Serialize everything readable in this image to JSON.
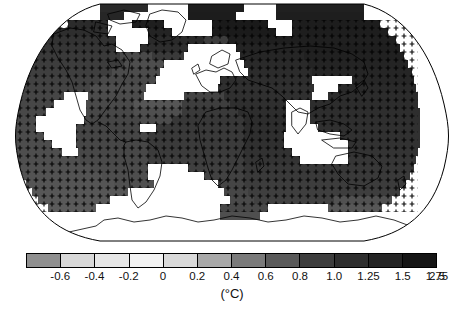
{
  "figure": {
    "type": "global-temperature-anomaly-map",
    "projection": "Robinson"
  },
  "chart_data": {
    "type": "heatmap",
    "title": "",
    "subtitle": "",
    "xlabel": "",
    "ylabel": "",
    "units": "(°C)",
    "projection": "Robinson",
    "grid": false,
    "legend_position": "bottom",
    "colormap": "grayscale-discrete-light-to-dark",
    "stippling": {
      "marker": "+",
      "meaning": "statistically significant change",
      "color": "#000000"
    },
    "nodata": {
      "fill": "#ffffff",
      "meaning": "insufficient data / masked"
    },
    "colorbar": {
      "orientation": "horizontal",
      "label": "(°C)",
      "tick_labels": [
        "-0.6",
        "-0.4",
        "-0.2",
        "0",
        "0.2",
        "0.4",
        "0.6",
        "0.8",
        "1.0",
        "1.25",
        "1.5",
        "1.75",
        "2.5"
      ],
      "boundaries": [
        -0.6,
        -0.4,
        -0.2,
        0,
        0.2,
        0.4,
        0.6,
        0.8,
        1.0,
        1.25,
        1.5,
        1.75,
        2.5
      ],
      "segment_colors": [
        "#8f8f8f",
        "#d8d8d8",
        "#e6e6e6",
        "#f2f2f2",
        "#d9d9d9",
        "#a8a8a8",
        "#7a7a7a",
        "#5a5a5a",
        "#3d3d3d",
        "#2e2e2e",
        "#242424",
        "#151515"
      ],
      "n_segments": 12,
      "extend": "neither"
    },
    "value_range_displayed": [
      -0.6,
      2.5
    ]
  },
  "colorbar_ticks": [
    {
      "label": "-0.6",
      "position_pct": 8.33
    },
    {
      "label": "-0.4",
      "position_pct": 16.67
    },
    {
      "label": "-0.2",
      "position_pct": 25.0
    },
    {
      "label": "0",
      "position_pct": 33.33
    },
    {
      "label": "0.2",
      "position_pct": 41.67
    },
    {
      "label": "0.4",
      "position_pct": 50.0
    },
    {
      "label": "0.6",
      "position_pct": 58.33
    },
    {
      "label": "0.8",
      "position_pct": 66.67
    },
    {
      "label": "1.0",
      "position_pct": 75.0
    },
    {
      "label": "1.25",
      "position_pct": 83.33
    },
    {
      "label": "1.5",
      "position_pct": 91.67
    },
    {
      "label": "1.75",
      "position_pct": 100.0
    },
    {
      "label": "2.5",
      "position_pct": 108.0
    }
  ],
  "colorbar_segments": [
    {
      "color": "#8f8f8f"
    },
    {
      "color": "#d8d8d8"
    },
    {
      "color": "#e6e6e6"
    },
    {
      "color": "#f2f2f2"
    },
    {
      "color": "#d9d9d9"
    },
    {
      "color": "#a8a8a8"
    },
    {
      "color": "#7a7a7a"
    },
    {
      "color": "#5a5a5a"
    },
    {
      "color": "#3d3d3d"
    },
    {
      "color": "#2e2e2e"
    },
    {
      "color": "#242424"
    },
    {
      "color": "#151515"
    }
  ],
  "axis_label": "(°C)"
}
